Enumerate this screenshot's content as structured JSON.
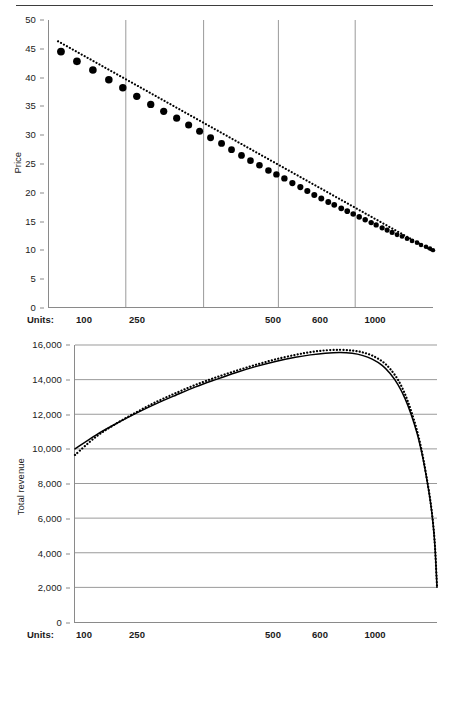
{
  "figure": {
    "has_top_rule": true,
    "rule_color": "#3d3d3d"
  },
  "chart_data": [
    {
      "id": "price-chart",
      "type": "scatter",
      "title": "",
      "xlabel": "Units:",
      "ylabel": "Price",
      "ylim": [
        0,
        50
      ],
      "yticks": [
        "0",
        "5",
        "10",
        "15",
        "20",
        "25",
        "30",
        "35",
        "40",
        "45",
        "50"
      ],
      "ytick_values": [
        0,
        5,
        10,
        15,
        20,
        25,
        30,
        35,
        40,
        45,
        50
      ],
      "xtick_labels": [
        "100",
        "250",
        "500",
        "600",
        "1000"
      ],
      "xtick_positions_px": [
        84,
        137,
        273,
        320,
        375
      ],
      "gridlines_vertical_px": [
        125,
        203,
        278,
        355
      ],
      "grid": "vertical",
      "legend": "none",
      "series": [
        {
          "name": "Demand (observed price)",
          "style": "filled-circles",
          "marker_color": "#000000",
          "points": [
            [
              60,
              44.5
            ],
            [
              76,
              42.8
            ],
            [
              92,
              41.3
            ],
            [
              108,
              39.6
            ],
            [
              122,
              38.2
            ],
            [
              136,
              36.7
            ],
            [
              150,
              35.3
            ],
            [
              163,
              34.1
            ],
            [
              176,
              32.9
            ],
            [
              188,
              31.7
            ],
            [
              199,
              30.6
            ],
            [
              210,
              29.5
            ],
            [
              221,
              28.5
            ],
            [
              231,
              27.4
            ],
            [
              241,
              26.4
            ],
            [
              250,
              25.5
            ],
            [
              259,
              24.7
            ],
            [
              268,
              23.8
            ],
            [
              276,
              23.1
            ],
            [
              284,
              22.4
            ],
            [
              292,
              21.6
            ],
            [
              300,
              20.9
            ],
            [
              307,
              20.2
            ],
            [
              314,
              19.5
            ],
            [
              321,
              18.9
            ],
            [
              328,
              18.3
            ],
            [
              334,
              17.8
            ],
            [
              341,
              17.2
            ],
            [
              347,
              16.7
            ],
            [
              353,
              16.2
            ],
            [
              359,
              15.7
            ],
            [
              365,
              15.2
            ],
            [
              371,
              14.7
            ],
            [
              376,
              14.3
            ],
            [
              382,
              13.8
            ],
            [
              387,
              13.4
            ],
            [
              392,
              13.0
            ],
            [
              397,
              12.6
            ],
            [
              402,
              12.3
            ],
            [
              407,
              11.9
            ],
            [
              412,
              11.5
            ],
            [
              417,
              11.2
            ],
            [
              421,
              10.8
            ],
            [
              426,
              10.5
            ],
            [
              430,
              10.2
            ],
            [
              433,
              9.9
            ]
          ]
        },
        {
          "name": "Linear trend",
          "style": "dotted-line",
          "line_color": "#000000",
          "endpoints": [
            [
              57,
              46.3
            ],
            [
              433,
              9.7
            ]
          ]
        }
      ]
    },
    {
      "id": "revenue-chart",
      "type": "line",
      "title": "",
      "xlabel": "Units:",
      "ylabel": "Total revenue",
      "ylim": [
        0,
        16000
      ],
      "yticks": [
        "0",
        "2,000",
        "4,000",
        "6,000",
        "8,000",
        "10,000",
        "12,000",
        "14,000",
        "16,000"
      ],
      "ytick_values": [
        0,
        2000,
        4000,
        6000,
        8000,
        10000,
        12000,
        14000,
        16000
      ],
      "xtick_labels": [
        "100",
        "250",
        "500",
        "600",
        "1000"
      ],
      "xtick_positions_px": [
        84,
        137,
        273,
        320,
        375
      ],
      "grid": "horizontal",
      "legend": "none",
      "series": [
        {
          "name": "Total revenue (actual)",
          "style": "solid-line",
          "line_color": "#000000",
          "points": [
            [
              74,
              10000
            ],
            [
              95,
              10800
            ],
            [
              115,
              11450
            ],
            [
              135,
              12050
            ],
            [
              155,
              12600
            ],
            [
              175,
              13100
            ],
            [
              195,
              13580
            ],
            [
              215,
              14000
            ],
            [
              235,
              14400
            ],
            [
              255,
              14750
            ],
            [
              275,
              15050
            ],
            [
              295,
              15290
            ],
            [
              310,
              15430
            ],
            [
              325,
              15530
            ],
            [
              340,
              15570
            ],
            [
              352,
              15520
            ],
            [
              362,
              15400
            ],
            [
              372,
              15180
            ],
            [
              382,
              14820
            ],
            [
              390,
              14350
            ],
            [
              398,
              13700
            ],
            [
              405,
              12900
            ],
            [
              411,
              12000
            ],
            [
              417,
              10900
            ],
            [
              422,
              9700
            ],
            [
              426,
              8500
            ],
            [
              430,
              7100
            ],
            [
              433,
              5700
            ],
            [
              435,
              4300
            ],
            [
              437,
              2000
            ]
          ]
        },
        {
          "name": "Total revenue (fitted)",
          "style": "dotted-line",
          "line_color": "#000000",
          "points": [
            [
              74,
              9650
            ],
            [
              95,
              10700
            ],
            [
              115,
              11450
            ],
            [
              135,
              12100
            ],
            [
              155,
              12700
            ],
            [
              175,
              13220
            ],
            [
              195,
              13700
            ],
            [
              215,
              14120
            ],
            [
              235,
              14500
            ],
            [
              255,
              14850
            ],
            [
              275,
              15170
            ],
            [
              295,
              15430
            ],
            [
              310,
              15590
            ],
            [
              325,
              15690
            ],
            [
              340,
              15720
            ],
            [
              352,
              15680
            ],
            [
              362,
              15580
            ],
            [
              372,
              15390
            ],
            [
              382,
              15060
            ],
            [
              390,
              14620
            ],
            [
              398,
              13980
            ],
            [
              405,
              13150
            ],
            [
              411,
              12200
            ],
            [
              417,
              11050
            ],
            [
              422,
              9800
            ],
            [
              426,
              8550
            ],
            [
              430,
              7150
            ],
            [
              433,
              5750
            ],
            [
              435,
              4350
            ],
            [
              437,
              2050
            ]
          ]
        }
      ]
    }
  ]
}
